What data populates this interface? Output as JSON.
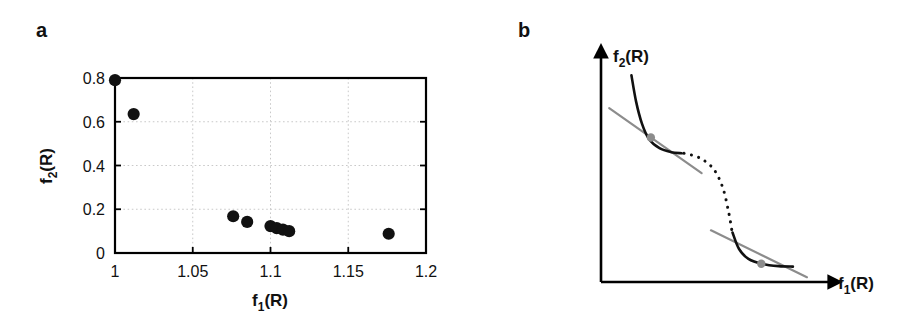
{
  "figure": {
    "panels": [
      {
        "id": "a",
        "label": "a"
      },
      {
        "id": "b",
        "label": "b"
      }
    ]
  },
  "panel_a": {
    "label": "a",
    "xaxis_title_main": "f",
    "xaxis_title_sub": "1",
    "xaxis_title_tail": "(R)",
    "yaxis_title_main": "f",
    "yaxis_title_sub": "2",
    "yaxis_title_tail": "(R)",
    "xticks": [
      "1",
      "1.05",
      "1.1",
      "1.15",
      "1.2"
    ],
    "yticks": [
      "0",
      "0.2",
      "0.4",
      "0.6",
      "0.8"
    ]
  },
  "panel_b": {
    "label": "b",
    "yaxis_title_main": "f",
    "yaxis_title_sub": "2",
    "yaxis_title_tail": "(R)",
    "xaxis_title_main": "f",
    "xaxis_title_sub": "1",
    "xaxis_title_tail": "(R)"
  },
  "colors": {
    "point": "#111111",
    "grid": "#c9c9c9",
    "axis": "#000000",
    "tangent": "#8c8c8c",
    "tangent_point": "#8c8c8c",
    "background": "#ffffff"
  },
  "chart_data": [
    {
      "type": "scatter",
      "panel": "a",
      "title": "",
      "xlabel": "f1(R)",
      "ylabel": "f2(R)",
      "xlim": [
        1,
        1.2
      ],
      "ylim": [
        0,
        0.8
      ],
      "xticks": [
        1,
        1.05,
        1.1,
        1.15,
        1.2
      ],
      "yticks": [
        0,
        0.2,
        0.4,
        0.6,
        0.8
      ],
      "grid": true,
      "legend": "none",
      "marker": "filled-circle",
      "marker_color": "#111111",
      "points": [
        {
          "x": 1.0,
          "y": 0.79
        },
        {
          "x": 1.012,
          "y": 0.635
        },
        {
          "x": 1.076,
          "y": 0.168
        },
        {
          "x": 1.085,
          "y": 0.142
        },
        {
          "x": 1.1,
          "y": 0.123
        },
        {
          "x": 1.104,
          "y": 0.114
        },
        {
          "x": 1.108,
          "y": 0.107
        },
        {
          "x": 1.112,
          "y": 0.1
        },
        {
          "x": 1.176,
          "y": 0.088
        }
      ]
    },
    {
      "type": "line",
      "panel": "b",
      "title": "",
      "xlabel": "f1(R)",
      "ylabel": "f2(R)",
      "schematic": true,
      "grid": false,
      "legend": "none",
      "description": "Non-convex Pareto front: two solid convex branches joined by a dotted S-shaped non-supported region, with two gray tangent (supporting) lines each touching a gray point.",
      "series": [
        {
          "name": "upper-solid-branch",
          "style": "solid",
          "color": "#111111",
          "points": [
            {
              "x": 0.13,
              "y": 0.94
            },
            {
              "x": 0.15,
              "y": 0.82
            },
            {
              "x": 0.175,
              "y": 0.72
            },
            {
              "x": 0.205,
              "y": 0.65
            },
            {
              "x": 0.25,
              "y": 0.608
            },
            {
              "x": 0.3,
              "y": 0.59
            },
            {
              "x": 0.345,
              "y": 0.585
            }
          ]
        },
        {
          "name": "dotted-middle-branch",
          "style": "dotted",
          "color": "#111111",
          "points": [
            {
              "x": 0.355,
              "y": 0.585
            },
            {
              "x": 0.42,
              "y": 0.565
            },
            {
              "x": 0.48,
              "y": 0.515
            },
            {
              "x": 0.52,
              "y": 0.43
            },
            {
              "x": 0.545,
              "y": 0.32
            },
            {
              "x": 0.56,
              "y": 0.23
            }
          ]
        },
        {
          "name": "lower-solid-branch",
          "style": "solid",
          "color": "#111111",
          "points": [
            {
              "x": 0.562,
              "y": 0.225
            },
            {
              "x": 0.59,
              "y": 0.15
            },
            {
              "x": 0.63,
              "y": 0.105
            },
            {
              "x": 0.69,
              "y": 0.082
            },
            {
              "x": 0.76,
              "y": 0.072
            },
            {
              "x": 0.82,
              "y": 0.07
            }
          ]
        },
        {
          "name": "upper-tangent-line",
          "style": "solid",
          "color": "#8c8c8c",
          "points": [
            {
              "x": 0.035,
              "y": 0.79
            },
            {
              "x": 0.43,
              "y": 0.495
            }
          ]
        },
        {
          "name": "lower-tangent-line",
          "style": "solid",
          "color": "#8c8c8c",
          "points": [
            {
              "x": 0.47,
              "y": 0.235
            },
            {
              "x": 0.88,
              "y": 0.022
            }
          ]
        }
      ],
      "tangent_points": [
        {
          "name": "upper-tangent-point",
          "x": 0.213,
          "y": 0.657,
          "color": "#8c8c8c"
        },
        {
          "name": "lower-tangent-point",
          "x": 0.685,
          "y": 0.083,
          "color": "#8c8c8c"
        }
      ]
    }
  ]
}
